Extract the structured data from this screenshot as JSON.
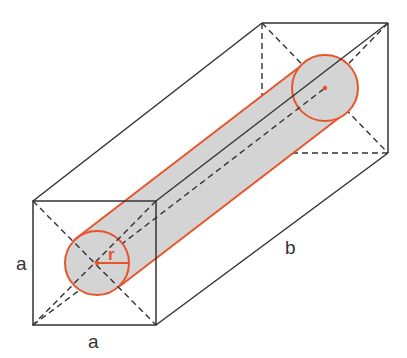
{
  "labels": {
    "front_height": "a",
    "front_width": "a",
    "length": "b",
    "radius": "r"
  },
  "colors": {
    "edge": "#333333",
    "cylinder_outline": "#e8542a",
    "cylinder_fill": "#d4d4d4",
    "background": "#ffffff"
  },
  "geometry": {
    "front_face": {
      "x": 33,
      "y": 201,
      "w": 123,
      "h": 124
    },
    "back_face": {
      "x": 262,
      "y": 23,
      "w": 126,
      "h": 130
    },
    "front_circle": {
      "cx": 97,
      "cy": 263,
      "r": 32
    },
    "back_circle": {
      "cx": 325,
      "cy": 88,
      "r": 33
    }
  }
}
